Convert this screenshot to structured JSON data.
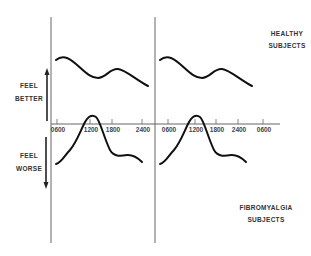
{
  "chart_data": {
    "type": "line",
    "title": "",
    "xlabel": "Time of day",
    "ylabel": "",
    "y_direction_labels": {
      "up": "FEEL BETTER",
      "down": "FEEL WORSE"
    },
    "x_ticks": [
      "0600",
      "1200",
      "1800",
      "2400",
      "0600",
      "1200",
      "1800",
      "2400",
      "0600"
    ],
    "grid": false,
    "annotations": [
      {
        "text_lines": [
          "HEALTHY",
          "SUBJECTS"
        ],
        "placement": "top-right"
      },
      {
        "text_lines": [
          "FIBROMYALGIA",
          "SUBJECTS"
        ],
        "placement": "bottom-right"
      }
    ],
    "series": [
      {
        "name": "Healthy subjects",
        "description": "Schematic curve repeated over two days; peak early morning, dip mid-day, secondary rise late afternoon, decline at night",
        "x": [
          "0600",
          "0800",
          "1200",
          "1500",
          "1800",
          "2100",
          "2400"
        ],
        "relative_values": [
          0.95,
          0.85,
          0.45,
          0.52,
          0.7,
          0.5,
          0.2
        ],
        "days": 2
      },
      {
        "name": "Fibromyalgia subjects",
        "description": "Schematic curve repeated over two days; feel worst early morning, peak near 1200-1300, drop in afternoon, low plateau through night",
        "x": [
          "0600",
          "0900",
          "1200",
          "1300",
          "1600",
          "1800",
          "2100",
          "2400"
        ],
        "relative_values": [
          -0.85,
          -0.55,
          0.05,
          0.08,
          -0.6,
          -0.72,
          -0.68,
          -0.82
        ],
        "days": 2
      }
    ]
  },
  "labels": {
    "feel_better": [
      "FEEL",
      "BETTER"
    ],
    "feel_worse": [
      "FEEL",
      "WORSE"
    ],
    "healthy": [
      "HEALTHY",
      "SUBJECTS"
    ],
    "fibromyalgia": [
      "FIBROMYALGIA",
      "SUBJECTS"
    ]
  }
}
